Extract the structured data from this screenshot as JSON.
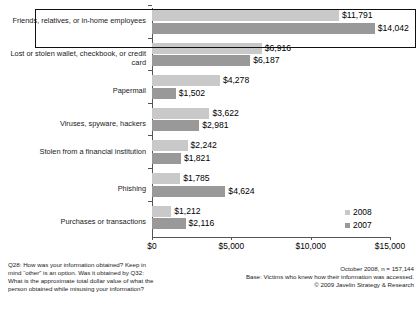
{
  "chart_data": {
    "type": "bar",
    "orientation": "horizontal",
    "title": "",
    "xlabel": "",
    "ylabel": "",
    "xlim": [
      0,
      15000
    ],
    "xticks": [
      0,
      5000,
      10000,
      15000
    ],
    "xtick_labels": [
      "$0",
      "$5,000",
      "$10,000",
      "$15,000"
    ],
    "grid": false,
    "legend_position": "bottom-right",
    "categories": [
      "Friends, relatives, or in-home employees",
      "Lost or stolen wallet, checkbook, or credit card",
      "Papermail",
      "Viruses, spyware, hackers",
      "Stolen from a financial institution",
      "Phishing",
      "Purchases or transactions"
    ],
    "series": [
      {
        "name": "2008",
        "color": "#c9c9c9",
        "values": [
          11791,
          6916,
          4278,
          3622,
          2242,
          1785,
          1212
        ],
        "labels": [
          "$11,791",
          "$6,916",
          "$4,278",
          "$3,622",
          "$2,242",
          "$1,785",
          "$1,212"
        ]
      },
      {
        "name": "2007",
        "color": "#999999",
        "values": [
          14042,
          6187,
          1502,
          2981,
          1821,
          4624,
          2116
        ],
        "labels": [
          "$14,042",
          "$6,187",
          "$1,502",
          "$2,981",
          "$1,821",
          "$4,624",
          "$2,116"
        ]
      }
    ],
    "highlighted_category": "Friends, relatives, or in-home employees"
  },
  "legend": {
    "items": [
      {
        "label": "2008",
        "color": "#c9c9c9"
      },
      {
        "label": "2007",
        "color": "#999999"
      }
    ]
  },
  "footnotes": {
    "left": [
      "Q28: How was your information obtained? Keep in",
      "mind “other” is an option. Was it obtained by Q32:",
      "What is the approximate total dollar value of what the",
      "person obtained while misusing your information?"
    ],
    "right": [
      "October 2008, n = 157,144",
      "Base: Victims who knew how their information was accessed.",
      "© 2009 Javelin Strategy & Research"
    ]
  }
}
